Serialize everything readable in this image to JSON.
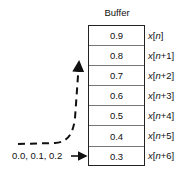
{
  "diagram": {
    "title": "Buffer",
    "cells": [
      "0.9",
      "0.8",
      "0.7",
      "0.6",
      "0.5",
      "0.4",
      "0.3"
    ],
    "labels": [
      {
        "var": "x",
        "open": "[",
        "idx": "n",
        "suffix": "",
        "close": "]"
      },
      {
        "var": "x",
        "open": "[",
        "idx": "n",
        "suffix": "+1",
        "close": "]"
      },
      {
        "var": "x",
        "open": "[",
        "idx": "n",
        "suffix": "+2",
        "close": "]"
      },
      {
        "var": "x",
        "open": "[",
        "idx": "n",
        "suffix": "+3",
        "close": "]"
      },
      {
        "var": "x",
        "open": "[",
        "idx": "n",
        "suffix": "+4",
        "close": "]"
      },
      {
        "var": "x",
        "open": "[",
        "idx": "n",
        "suffix": "+5",
        "close": "]"
      },
      {
        "var": "x",
        "open": "[",
        "idx": "n",
        "suffix": "+6",
        "close": "]"
      }
    ],
    "input_label": "0.0, 0.1, 0.2",
    "colors": {
      "stroke": "#222222",
      "divider": "#777777",
      "arrow": "#111111"
    }
  }
}
